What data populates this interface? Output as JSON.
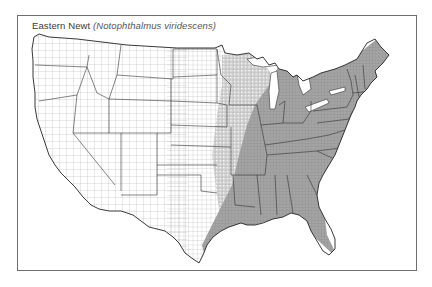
{
  "title": {
    "common_name": "Eastern Newt",
    "scientific_name": "(Notophthalmus viridescens)"
  },
  "map": {
    "region": "Contiguous United States (county boundaries)",
    "legend": {
      "range_fill": "#9a9a9a",
      "outside_fill": "#ffffff",
      "county_line": "#8a8a8a",
      "state_line": "#333333"
    },
    "range_description": "Shaded across eastern US: east Texas, Oklahoma (east), Missouri, Arkansas, Louisiana, Mississippi, Alabama, Georgia, Florida, Tennessee, Kentucky, Illinois, Indiana, Ohio, Michigan, Wisconsin (patchy), Minnesota (east, patchy), Iowa (east, patchy), Carolinas, Virginias, Mid-Atlantic, New England, New York, Pennsylvania, Maine"
  }
}
